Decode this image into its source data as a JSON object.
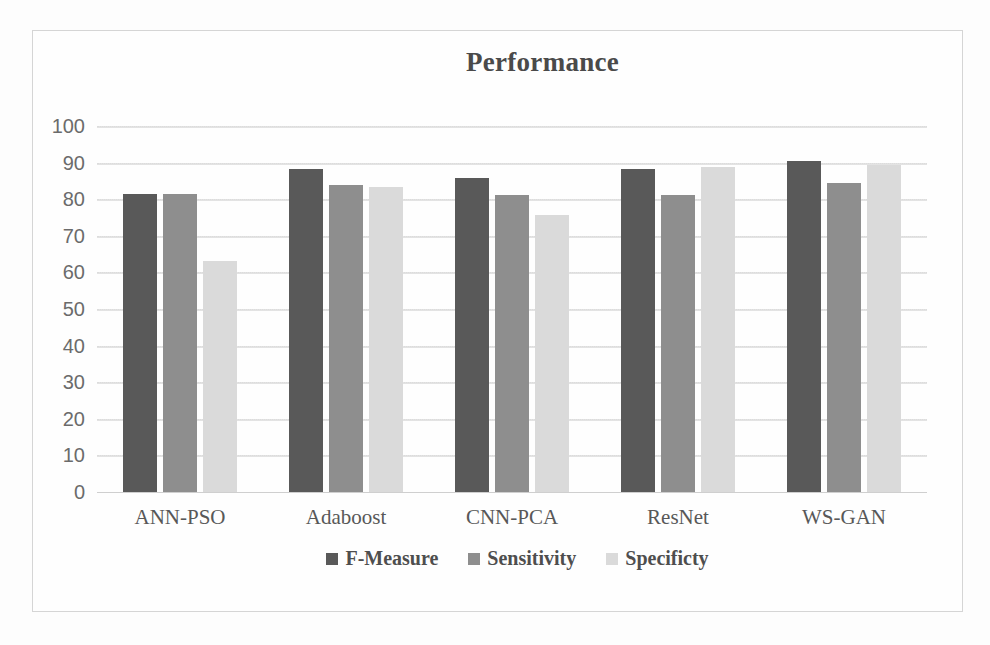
{
  "chart_data": {
    "type": "bar",
    "title": "Performance",
    "xlabel": "",
    "ylabel": "",
    "ylim": [
      0,
      100
    ],
    "yticks": [
      100,
      90,
      80,
      70,
      60,
      50,
      40,
      30,
      20,
      10,
      0
    ],
    "grid": true,
    "legend_position": "bottom",
    "categories": [
      "ANN-PSO",
      "Adaboost",
      "CNN-PCA",
      "ResNet",
      "WS-GAN"
    ],
    "series": [
      {
        "name": "F-Measure",
        "color": "#595959",
        "values": [
          81.4,
          88.3,
          85.8,
          88.3,
          90.4
        ]
      },
      {
        "name": "Sensitivity",
        "color": "#8e8e8e",
        "values": [
          81.3,
          84.0,
          81.1,
          81.2,
          84.5
        ]
      },
      {
        "name": "Specificty",
        "color": "#dadada",
        "values": [
          63.0,
          83.3,
          75.6,
          88.8,
          89.3
        ]
      }
    ]
  },
  "colors": {
    "frame_border": "#d5d5d5",
    "gridline": "#e3e3e3",
    "baseline": "#cfcfcf",
    "axis_text": "#6b6b6b",
    "title_text": "#4a4a4a",
    "page_background": "#fdfdfd"
  }
}
